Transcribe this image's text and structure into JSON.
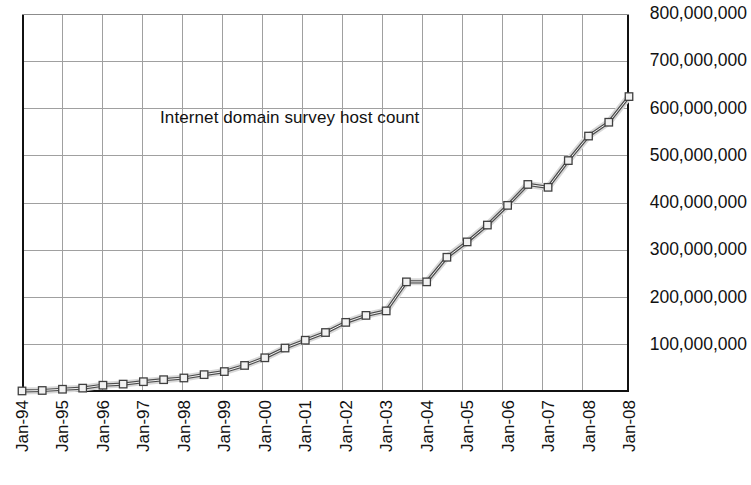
{
  "chart_data": {
    "type": "line",
    "title": "Internet domain survey host count",
    "xlabel": "",
    "ylabel": "",
    "grid": true,
    "legend": "none",
    "ylim": [
      0,
      800000000
    ],
    "y_ticks": [
      "800,000,000",
      "700,000,000",
      "600,000,000",
      "500,000,000",
      "400,000,000",
      "300,000,000",
      "200,000,000",
      "100,000,000"
    ],
    "y_tick_values": [
      800000000,
      700000000,
      600000000,
      500000000,
      400000000,
      300000000,
      200000000,
      100000000
    ],
    "x_tick_labels": [
      "Jan-94",
      "Jan-95",
      "Jan-96",
      "Jan-97",
      "Jan-98",
      "Jan-99",
      "Jan-00",
      "Jan-01",
      "Jan-02",
      "Jan-03",
      "Jan-04",
      "Jan-05",
      "Jan-06",
      "Jan-07",
      "Jan-08",
      "Jan-08"
    ],
    "series": [
      {
        "name": "Internet domain survey host count",
        "x": [
          "Jan-94",
          "Jul-94",
          "Jan-95",
          "Jul-95",
          "Jan-96",
          "Jul-96",
          "Jan-97",
          "Jul-97",
          "Jan-98",
          "Jul-98",
          "Jan-99",
          "Jul-99",
          "Jan-00",
          "Jul-00",
          "Jan-01",
          "Jul-01",
          "Jan-02",
          "Jul-02",
          "Jan-03",
          "Jul-03",
          "Jan-04",
          "Jul-04",
          "Jan-05",
          "Jul-05",
          "Jan-06",
          "Jul-06",
          "Jan-07",
          "Jul-07",
          "Jan-08",
          "Jul-08",
          "Jan-09"
        ],
        "values": [
          2217000,
          3212000,
          5846000,
          8200000,
          14352000,
          16729000,
          21819000,
          26053000,
          29670000,
          36739000,
          43230000,
          56218000,
          72398000,
          93047000,
          109574000,
          125888000,
          147345000,
          162128000,
          171638000,
          233101000,
          233101000,
          285139000,
          317646000,
          353284000,
          394992000,
          439286000,
          433193000,
          489774000,
          541677000,
          570937000,
          625226000
        ]
      }
    ],
    "colors": {
      "line": "#4d4d4d",
      "line_highlight": "#d9d9d9",
      "marker_fill": "#f2f2f2",
      "marker_stroke": "#404040",
      "grid": "#a0a0a0",
      "axis": "#111111",
      "text": "#111111",
      "background": "#ffffff"
    }
  }
}
